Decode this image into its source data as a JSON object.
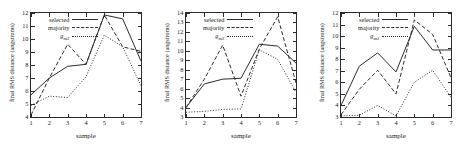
{
  "figure": {
    "panel_count": 3,
    "shared": {
      "xlabel": "sample",
      "ylabel": "final RMS distance (angstroms)",
      "xticks": [
        "1",
        "2",
        "3",
        "4",
        "5",
        "6",
        "7"
      ],
      "legend": {
        "selected": "selected",
        "majority": "majority",
        "gm2_main": "g",
        "gm2_sub": "m2"
      }
    },
    "panels": [
      {
        "name": "panel-left",
        "yticks": [
          "4",
          "5",
          "6",
          "7",
          "8",
          "9",
          "10",
          "11",
          "12"
        ]
      },
      {
        "name": "panel-middle",
        "yticks": [
          "3",
          "4",
          "5",
          "6",
          "7",
          "8",
          "9",
          "10",
          "11",
          "12",
          "13",
          "14"
        ]
      },
      {
        "name": "panel-right",
        "yticks": [
          "3",
          "4",
          "5",
          "6",
          "7",
          "8",
          "9",
          "10",
          "11",
          "12"
        ]
      }
    ]
  },
  "chart_data": [
    {
      "type": "line",
      "title": "",
      "xlabel": "sample",
      "ylabel": "final RMS distance (angstroms)",
      "x": [
        1,
        2,
        3,
        4,
        5,
        6,
        7
      ],
      "xlim": [
        1,
        7
      ],
      "ylim": [
        4,
        12
      ],
      "grid": false,
      "legend_position": "top-left",
      "series": [
        {
          "name": "selected",
          "style": "solid",
          "values": [
            5.7,
            7.0,
            7.9,
            8.05,
            11.85,
            11.55,
            8.3
          ]
        },
        {
          "name": "majority",
          "style": "dashed",
          "values": [
            4.15,
            7.0,
            9.6,
            8.05,
            11.85,
            9.4,
            9.05
          ]
        },
        {
          "name": "gm2",
          "style": "dotted",
          "values": [
            4.9,
            5.6,
            5.5,
            7.1,
            10.3,
            9.4,
            6.4
          ]
        }
      ]
    },
    {
      "type": "line",
      "title": "",
      "xlabel": "sample",
      "ylabel": "final RMS distance (angstroms)",
      "x": [
        1,
        2,
        3,
        4,
        5,
        6,
        7
      ],
      "xlim": [
        1,
        7
      ],
      "ylim": [
        3,
        14
      ],
      "grid": false,
      "legend_position": "top-left",
      "series": [
        {
          "name": "selected",
          "style": "solid",
          "values": [
            4.0,
            6.5,
            7.0,
            7.1,
            10.7,
            10.5,
            8.7
          ]
        },
        {
          "name": "majority",
          "style": "dashed",
          "values": [
            4.0,
            7.0,
            10.6,
            5.2,
            10.2,
            13.6,
            6.6
          ]
        },
        {
          "name": "gm2",
          "style": "dotted",
          "values": [
            3.5,
            3.6,
            3.8,
            3.85,
            10.1,
            9.1,
            5.6
          ]
        }
      ]
    },
    {
      "type": "line",
      "title": "",
      "xlabel": "sample",
      "ylabel": "final RMS distance (angstroms)",
      "x": [
        1,
        2,
        3,
        4,
        5,
        6,
        7
      ],
      "xlim": [
        1,
        7
      ],
      "ylim": [
        3,
        12
      ],
      "grid": false,
      "legend_position": "top-left",
      "series": [
        {
          "name": "selected",
          "style": "solid",
          "values": [
            4.0,
            7.4,
            8.55,
            6.9,
            10.85,
            8.8,
            8.8
          ]
        },
        {
          "name": "majority",
          "style": "dashed",
          "values": [
            3.2,
            5.4,
            7.05,
            5.0,
            11.4,
            10.15,
            6.4
          ]
        },
        {
          "name": "gm2",
          "style": "dotted",
          "values": [
            3.1,
            3.15,
            4.0,
            3.1,
            6.0,
            7.05,
            4.7
          ]
        }
      ]
    }
  ]
}
